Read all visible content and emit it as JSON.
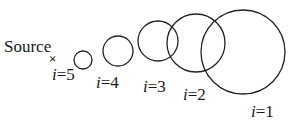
{
  "source": {
    "label": "Source",
    "marker": "×",
    "x": 54,
    "y": 57
  },
  "circles": [
    {
      "index": 5,
      "label": "i=5",
      "cx": 83,
      "cy": 60,
      "r": 9,
      "lx": 52,
      "ly": 80
    },
    {
      "index": 4,
      "label": "i=4",
      "cx": 118,
      "cy": 51,
      "r": 15,
      "lx": 96,
      "ly": 88
    },
    {
      "index": 3,
      "label": "i=3",
      "cx": 158,
      "cy": 41,
      "r": 20,
      "lx": 143,
      "ly": 92
    },
    {
      "index": 2,
      "label": "i=2",
      "cx": 196,
      "cy": 43,
      "r": 29,
      "lx": 183,
      "ly": 100
    },
    {
      "index": 1,
      "label": "i=1",
      "cx": 243,
      "cy": 52,
      "r": 42,
      "lx": 251,
      "ly": 117
    }
  ]
}
